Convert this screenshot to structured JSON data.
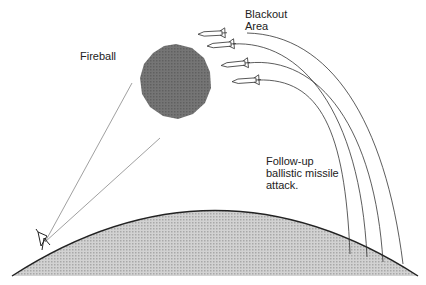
{
  "labels": {
    "fireball": "Fireball",
    "blackout": "Blackout\nArea",
    "followup": "Follow-up\nballistic missile\nattack."
  },
  "colors": {
    "fireball": "#6f6f6f",
    "ground": "#c4c4c4",
    "line": "#333333",
    "sightline": "#888888"
  },
  "elements": {
    "missiles": 4,
    "trajectories": 4,
    "radar_sightlines": 2
  }
}
